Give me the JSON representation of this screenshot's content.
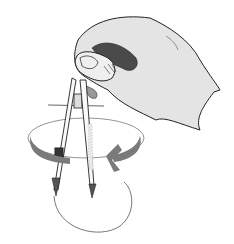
{
  "illustration": {
    "subject": "Hand rotating a drawing compass to draw a circle",
    "elements": [
      "hand",
      "compass",
      "rotation-arrow",
      "drawn-circle"
    ],
    "colors": {
      "background": "#ffffff",
      "ink": "#222222",
      "hand_fill": "#e4e4e4",
      "hand_shadow": "#4a4a4a",
      "arrow": "#7a7a7a",
      "circle_line": "#555555"
    }
  }
}
